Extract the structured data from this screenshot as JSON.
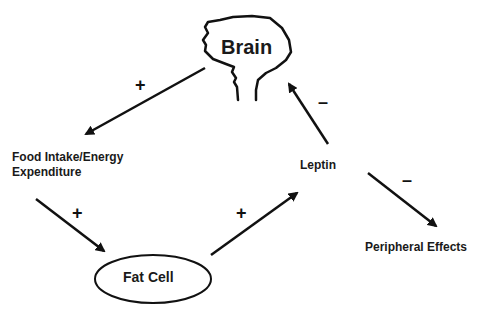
{
  "diagram": {
    "nodes": {
      "brain": "Brain",
      "food_intake_line1": "Food Intake/Energy",
      "food_intake_line2": "Expenditure",
      "fat_cell": "Fat Cell",
      "leptin": "Leptin",
      "peripheral": "Peripheral Effects"
    },
    "edges": [
      {
        "from": "Brain",
        "to": "Food Intake/Energy Expenditure",
        "sign": "+"
      },
      {
        "from": "Food Intake/Energy Expenditure",
        "to": "Fat Cell",
        "sign": "+"
      },
      {
        "from": "Fat Cell",
        "to": "Leptin",
        "sign": "+"
      },
      {
        "from": "Leptin",
        "to": "Brain",
        "sign": "–"
      },
      {
        "from": "Leptin",
        "to": "Peripheral Effects",
        "sign": "–"
      }
    ],
    "colors": {
      "stroke": "#111111",
      "background": "#ffffff"
    }
  }
}
